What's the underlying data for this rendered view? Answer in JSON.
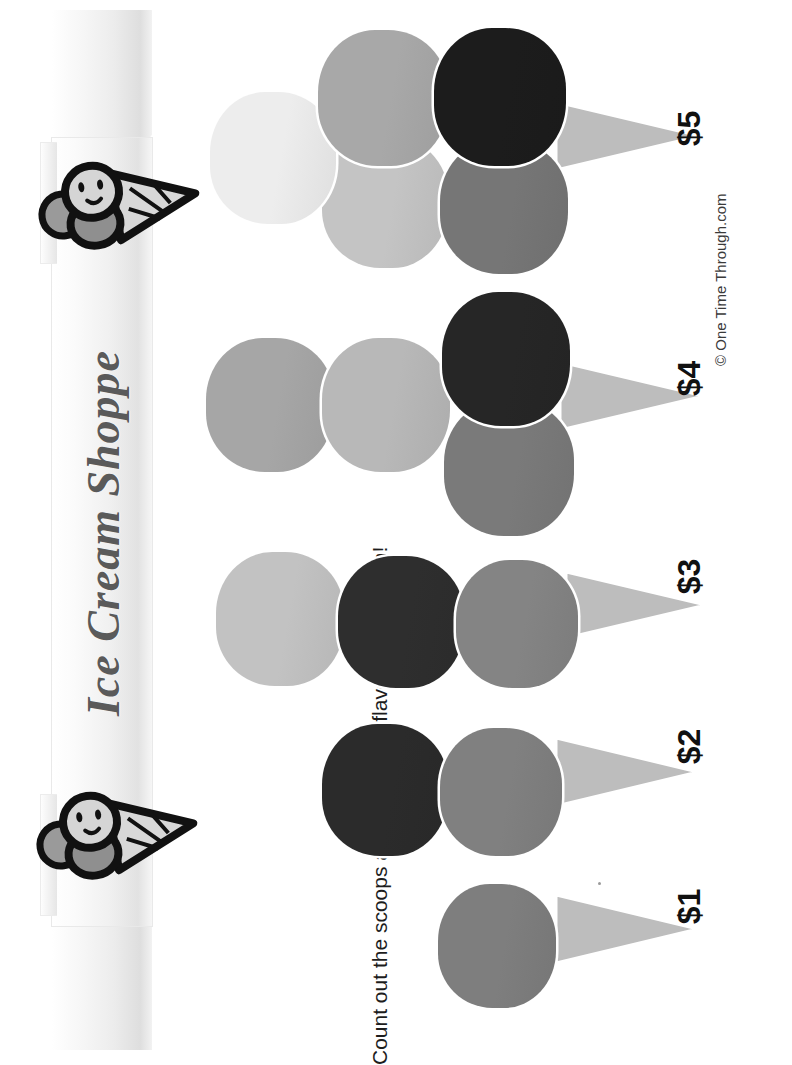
{
  "page": {
    "title": "Ice Cream Shoppe",
    "instruction": "Count out the scoops and match the flavours if you can!",
    "copyright": "© One Time Through.com",
    "orientation": "rotated-90",
    "background": "#ffffff"
  },
  "banner": {
    "label": "Ice Cream Shoppe",
    "text_color": "#5a5a5a",
    "paper_color": "#f2f2f2"
  },
  "mascots": [
    {
      "name": "ice-cream-cone-mascot-top",
      "description": "smiling ice cream cone character"
    },
    {
      "name": "ice-cream-cone-mascot-bottom",
      "description": "smiling ice cream cone character"
    }
  ],
  "palette": {
    "scoop_lightest": "#ededed",
    "scoop_light": "#c9c9c9",
    "scoop_mid_light": "#b4b4b4",
    "scoop_mid": "#a8a8a8",
    "scoop_gray": "#8f8f8f",
    "scoop_dark_gray": "#767676",
    "scoop_dark": "#3a3a3a",
    "scoop_black": "#1c1c1c",
    "cone": "#bdbdbd",
    "outline": "#ffffff"
  },
  "cones": [
    {
      "price": "$1",
      "scoop_count": 1,
      "scoops": [
        {
          "color": "#7e7e7e",
          "size": 118,
          "x": 438,
          "y": 884,
          "layer": "main"
        }
      ],
      "cone": {
        "x": 556,
        "y": 893,
        "w": 142,
        "h": 72
      },
      "price_pos": {
        "x": 672,
        "y": 888
      }
    },
    {
      "price": "$2",
      "scoop_count": 2,
      "scoops": [
        {
          "color": "#2b2b2b",
          "size": 126,
          "x": 322,
          "y": 724,
          "layer": "main"
        },
        {
          "color": "#808080",
          "size": 122,
          "x": 440,
          "y": 728,
          "layer": "main"
        }
      ],
      "cone": {
        "x": 556,
        "y": 736,
        "w": 142,
        "h": 72
      },
      "price_pos": {
        "x": 672,
        "y": 728
      }
    },
    {
      "price": "$3",
      "scoop_count": 3,
      "scoops": [
        {
          "color": "#c2c2c2",
          "size": 128,
          "x": 216,
          "y": 552,
          "layer": "main"
        },
        {
          "color": "#2e2e2e",
          "size": 126,
          "x": 338,
          "y": 556,
          "layer": "main"
        },
        {
          "color": "#848484",
          "size": 122,
          "x": 456,
          "y": 560,
          "layer": "main"
        }
      ],
      "cone": {
        "x": 566,
        "y": 570,
        "w": 140,
        "h": 70
      },
      "price_pos": {
        "x": 672,
        "y": 558
      }
    },
    {
      "price": "$4",
      "scoop_count": 4,
      "scoops": [
        {
          "color": "#a6a6a6",
          "size": 128,
          "x": 206,
          "y": 338,
          "layer": "main"
        },
        {
          "color": "#b8b8b8",
          "size": 128,
          "x": 322,
          "y": 338,
          "layer": "main"
        },
        {
          "color": "#262626",
          "size": 128,
          "x": 442,
          "y": 292,
          "layer": "main"
        },
        {
          "color": "#7a7a7a",
          "size": 130,
          "x": 444,
          "y": 400,
          "layer": "offset"
        }
      ],
      "cone": {
        "x": 560,
        "y": 360,
        "w": 144,
        "h": 72
      },
      "price_pos": {
        "x": 672,
        "y": 360
      }
    },
    {
      "price": "$5",
      "scoop_count": 5,
      "scoops": [
        {
          "color": "#ededed",
          "size": 126,
          "x": 210,
          "y": 92,
          "layer": "main"
        },
        {
          "color": "#a8a8a8",
          "size": 130,
          "x": 318,
          "y": 30,
          "layer": "main"
        },
        {
          "color": "#c4c4c4",
          "size": 126,
          "x": 322,
          "y": 136,
          "layer": "offset"
        },
        {
          "color": "#1c1c1c",
          "size": 132,
          "x": 434,
          "y": 28,
          "layer": "main"
        },
        {
          "color": "#767676",
          "size": 128,
          "x": 440,
          "y": 140,
          "layer": "offset"
        }
      ],
      "cone": {
        "x": 556,
        "y": 100,
        "w": 144,
        "h": 72
      },
      "price_pos": {
        "x": 672,
        "y": 110
      }
    }
  ]
}
